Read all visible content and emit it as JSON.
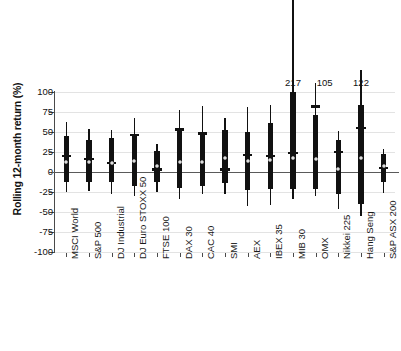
{
  "chart_data": {
    "type": "box",
    "title": "",
    "xlabel": "",
    "ylabel": "Rolling 12-month return (%)",
    "ylim": [
      -100,
      100
    ],
    "yticks": [
      100,
      75,
      50,
      25,
      0,
      -25,
      -50,
      -75,
      -100
    ],
    "ytick_labels": [
      "100",
      "75",
      "50",
      "25",
      "0",
      "-25",
      "-50",
      "-75",
      "-100"
    ],
    "grid": true,
    "legend": "none",
    "categories": [
      "MSCI World",
      "S&P 500",
      "DJ Industrial",
      "DJ Euro STOXX 50",
      "FTSE 100",
      "DAX 30",
      "CAC 40",
      "SMI",
      "AEX",
      "IBEX 35",
      "MIB 30",
      "OMX",
      "Nikkei 225",
      "Hang Seng",
      "S&P ASX 200"
    ],
    "series": [
      {
        "name": "MSCI World",
        "max": 62,
        "box_top": 45,
        "box_bottom": -13,
        "min": -25,
        "mean": 20,
        "median": 13,
        "annotation": ""
      },
      {
        "name": "S&P 500",
        "max": 54,
        "box_top": 40,
        "box_bottom": -12,
        "min": -24,
        "mean": 16,
        "median": 13,
        "annotation": ""
      },
      {
        "name": "DJ Industrial",
        "max": 52,
        "box_top": 42,
        "box_bottom": -13,
        "min": -27,
        "mean": 11,
        "median": 11,
        "annotation": ""
      },
      {
        "name": "DJ Euro STOXX 50",
        "max": 67,
        "box_top": 46,
        "box_bottom": -17,
        "min": -30,
        "mean": 46,
        "median": 14,
        "annotation": ""
      },
      {
        "name": "FTSE 100",
        "max": 35,
        "box_top": 26,
        "box_bottom": -12,
        "min": -25,
        "mean": 3,
        "median": 8,
        "annotation": ""
      },
      {
        "name": "DAX 30",
        "max": 77,
        "box_top": 53,
        "box_bottom": -20,
        "min": -34,
        "mean": 53,
        "median": 13,
        "annotation": ""
      },
      {
        "name": "CAC 40",
        "max": 83,
        "box_top": 48,
        "box_bottom": -17,
        "min": -27,
        "mean": 48,
        "median": 13,
        "annotation": ""
      },
      {
        "name": "SMI",
        "max": 67,
        "box_top": 52,
        "box_bottom": -14,
        "min": -27,
        "mean": 3,
        "median": 17,
        "annotation": ""
      },
      {
        "name": "AEX",
        "max": 81,
        "box_top": 50,
        "box_bottom": -22,
        "min": -42,
        "mean": 21,
        "median": 14,
        "annotation": ""
      },
      {
        "name": "IBEX 35",
        "max": 84,
        "box_top": 61,
        "box_bottom": -21,
        "min": -41,
        "mean": 20,
        "median": 15,
        "annotation": ""
      },
      {
        "name": "MIB 30",
        "max": 217,
        "box_top": 100,
        "box_bottom": -21,
        "min": -34,
        "mean": 24,
        "median": 17,
        "annotation": "217"
      },
      {
        "name": "OMX",
        "max": 105,
        "box_top": 71,
        "box_bottom": -21,
        "min": -30,
        "mean": 82,
        "median": 16,
        "annotation": "105"
      },
      {
        "name": "Nikkei 225",
        "max": 51,
        "box_top": 40,
        "box_bottom": -28,
        "min": -46,
        "mean": 25,
        "median": 4,
        "annotation": ""
      },
      {
        "name": "Hang Seng",
        "max": 122,
        "box_top": 84,
        "box_bottom": -40,
        "min": -55,
        "mean": 55,
        "median": 17,
        "annotation": "122"
      },
      {
        "name": "S&P ASX 200",
        "max": 29,
        "box_top": 22,
        "box_bottom": -12,
        "min": -26,
        "mean": 5,
        "median": 8,
        "annotation": ""
      }
    ],
    "colors": {
      "bar": "#111111",
      "grid": "#e3e3e3",
      "axis": "#4a4a4a",
      "zero_line": "#5a5a5a",
      "median_marker": "#9a9a9a",
      "background": "#ffffff"
    }
  }
}
